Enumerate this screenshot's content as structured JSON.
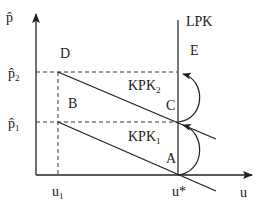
{
  "diagram": {
    "axes": {
      "y_label": "p̂",
      "x_label": "u"
    },
    "y_ticks": [
      {
        "base": "p̂",
        "sub": "2",
        "y": 72
      },
      {
        "base": "p̂",
        "sub": "1",
        "y": 122
      }
    ],
    "x_ticks": [
      {
        "base": "u",
        "sub": "1",
        "x": 58
      },
      {
        "base": "u*",
        "sub": "",
        "x": 178
      }
    ],
    "curves": {
      "lpk": "LPK",
      "kpk1_base": "KPK",
      "kpk1_sub": "1",
      "kpk2_base": "KPK",
      "kpk2_sub": "2"
    },
    "points": {
      "A": "A",
      "B": "B",
      "C": "C",
      "D": "D",
      "E": "E"
    },
    "arrows": [
      {
        "from": "A",
        "to": "C"
      },
      {
        "from": "C",
        "to": "E"
      }
    ]
  }
}
